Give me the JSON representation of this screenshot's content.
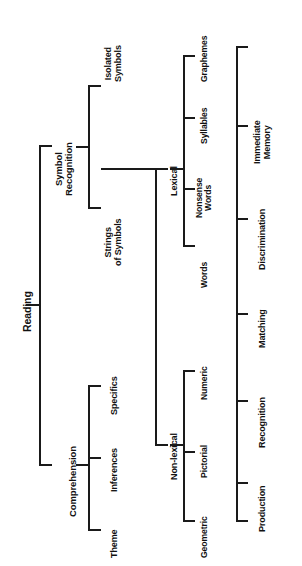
{
  "diagram": {
    "orientation": "rotated-90-ccw",
    "line_color": "#1a1a1a",
    "text_color": "#111111",
    "background": "#ffffff"
  },
  "tree": {
    "root": {
      "label": "Reading"
    },
    "level1": [
      {
        "label": "Symbol\nRecognition"
      },
      {
        "label": "Comprehension"
      }
    ],
    "symbol_children": [
      {
        "label": "Isolated\nSymbols"
      },
      {
        "label": "Strings\nof Symbols"
      }
    ],
    "comprehension_children": [
      {
        "label": "Theme"
      },
      {
        "label": "Inferences"
      },
      {
        "label": "Specifics"
      }
    ],
    "symbol_groups": [
      {
        "label": "Lexical"
      },
      {
        "label": "Non-lexical"
      }
    ],
    "lexical_children": [
      {
        "label": "Graphemes"
      },
      {
        "label": "Syllables"
      },
      {
        "label": "Nonsense\nWords"
      },
      {
        "label": "Words"
      }
    ],
    "nonlexical_children": [
      {
        "label": "Numeric"
      },
      {
        "label": "Pictorial"
      },
      {
        "label": "Geometric"
      }
    ],
    "tasks": [
      {
        "label": "Immediate\nMemory"
      },
      {
        "label": "Discrimination"
      },
      {
        "label": "Matching"
      },
      {
        "label": "Recognition"
      },
      {
        "label": "Production"
      }
    ]
  }
}
